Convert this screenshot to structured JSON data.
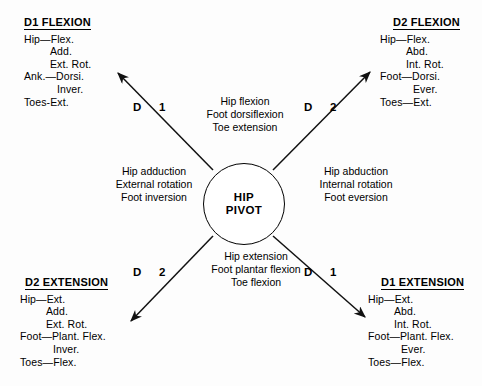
{
  "diagram": {
    "center": {
      "line1": "HIP",
      "line2": "PIVOT"
    },
    "corners": [
      {
        "key": "d1-flexion",
        "title": "D1 FLEXION",
        "rows": [
          {
            "text": "Hip—Flex.",
            "indent": 0
          },
          {
            "text": "Add.",
            "indent": 1
          },
          {
            "text": "Ext. Rot.",
            "indent": 1
          },
          {
            "text": "Ank.—Dorsi.",
            "indent": 0
          },
          {
            "text": "Inver.",
            "indent": 2
          },
          {
            "text": "Toes-Ext.",
            "indent": 0
          }
        ]
      },
      {
        "key": "d2-flexion",
        "title": "D2 FLEXION",
        "rows": [
          {
            "text": "Hip—Flex.",
            "indent": 0
          },
          {
            "text": "Abd.",
            "indent": 1
          },
          {
            "text": "Int. Rot.",
            "indent": 1
          },
          {
            "text": "Foot—Dorsi.",
            "indent": 0
          },
          {
            "text": "Ever.",
            "indent": 2
          },
          {
            "text": "Toes—Ext.",
            "indent": 0
          }
        ]
      },
      {
        "key": "d2-extension",
        "title": "D2 EXTENSION",
        "rows": [
          {
            "text": "Hip—Ext.",
            "indent": 0
          },
          {
            "text": "Add.",
            "indent": 1
          },
          {
            "text": "Ext. Rot.",
            "indent": 1
          },
          {
            "text": "Foot—Plant. Flex.",
            "indent": 0
          },
          {
            "text": "Inver.",
            "indent": 2
          },
          {
            "text": "Toes—Flex.",
            "indent": 0
          }
        ]
      },
      {
        "key": "d1-extension",
        "title": "D1 EXTENSION",
        "rows": [
          {
            "text": "Hip—Ext.",
            "indent": 0
          },
          {
            "text": "Abd.",
            "indent": 1
          },
          {
            "text": "Int. Rot.",
            "indent": 1
          },
          {
            "text": "Foot—Plant. Flex.",
            "indent": 0
          },
          {
            "text": "Ever.",
            "indent": 2
          },
          {
            "text": "Toes—Flex.",
            "indent": 0
          }
        ]
      }
    ],
    "quadrants": {
      "top": {
        "line1": "Hip flexion",
        "line2": "Foot dorsiflexion",
        "line3": "Toe extension"
      },
      "left": {
        "line1": "Hip adduction",
        "line2": "External rotation",
        "line3": "Foot inversion"
      },
      "right": {
        "line1": "Hip abduction",
        "line2": "Internal rotation",
        "line3": "Foot eversion"
      },
      "bottom": {
        "line1": "Hip extension",
        "line2": "Foot plantar flexion",
        "line3": "Toe flexion"
      }
    },
    "axis_labels": [
      {
        "key": "upper-left",
        "letter": "D",
        "number": "1"
      },
      {
        "key": "upper-right",
        "letter": "D",
        "number": "2"
      },
      {
        "key": "lower-left",
        "letter": "D",
        "number": "2"
      },
      {
        "key": "lower-right",
        "letter": "D",
        "number": "1"
      }
    ],
    "colors": {
      "ink": "#000000",
      "background": "#ffffff"
    }
  }
}
